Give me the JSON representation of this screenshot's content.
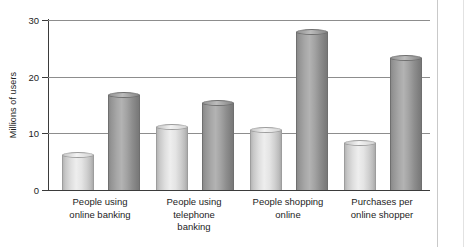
{
  "chart_data": {
    "type": "bar",
    "title": "",
    "xlabel": "",
    "ylabel": "Millions of users",
    "ylim": [
      0,
      30
    ],
    "yticks": [
      "0",
      "10",
      "20",
      "30"
    ],
    "grid": "horizontal",
    "legend": "none",
    "categories": [
      "People using\nonline banking",
      "People using\ntelephone\nbanking",
      "People shopping\nonline",
      "Purchases per\nonline shopper"
    ],
    "series": [
      {
        "name": "light",
        "values": [
          6.2,
          11.2,
          10.6,
          8.3
        ]
      },
      {
        "name": "dark",
        "values": [
          16.8,
          15.3,
          27.9,
          23.3
        ]
      }
    ],
    "colors": {
      "light_bar": "#e0e0e0",
      "dark_bar": "#a0a0a0",
      "gridline": "#8d8d8d",
      "axis": "#3b3b3b",
      "background": "#ffffff"
    }
  }
}
